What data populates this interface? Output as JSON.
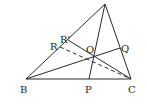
{
  "diagram": {
    "type": "triangle-cevians",
    "points": {
      "A": {
        "x": 105,
        "y": 4,
        "label": ""
      },
      "B": {
        "x": 26,
        "y": 79,
        "label": "B"
      },
      "C": {
        "x": 131,
        "y": 79,
        "label": "C"
      },
      "P": {
        "x": 89,
        "y": 79,
        "label": "P"
      },
      "Q": {
        "x": 120,
        "y": 48,
        "label": "Q"
      },
      "R": {
        "x": 60,
        "y": 47,
        "label": "R"
      },
      "R_prime": {
        "x": 68,
        "y": 40,
        "label": "R'"
      },
      "O": {
        "x": 93,
        "y": 56,
        "label": "O"
      }
    },
    "segments": [
      {
        "from": "A",
        "to": "B",
        "style": "solid"
      },
      {
        "from": "A",
        "to": "C",
        "style": "solid"
      },
      {
        "from": "B",
        "to": "C",
        "style": "solid"
      },
      {
        "from": "A",
        "to": "P",
        "style": "solid"
      },
      {
        "from": "B",
        "to": "Q",
        "style": "solid"
      },
      {
        "from": "R_prime",
        "to": "C",
        "style": "solid"
      },
      {
        "from": "R",
        "to": "C",
        "style": "dashed"
      }
    ],
    "stroke_color": "#2a2a2a"
  }
}
